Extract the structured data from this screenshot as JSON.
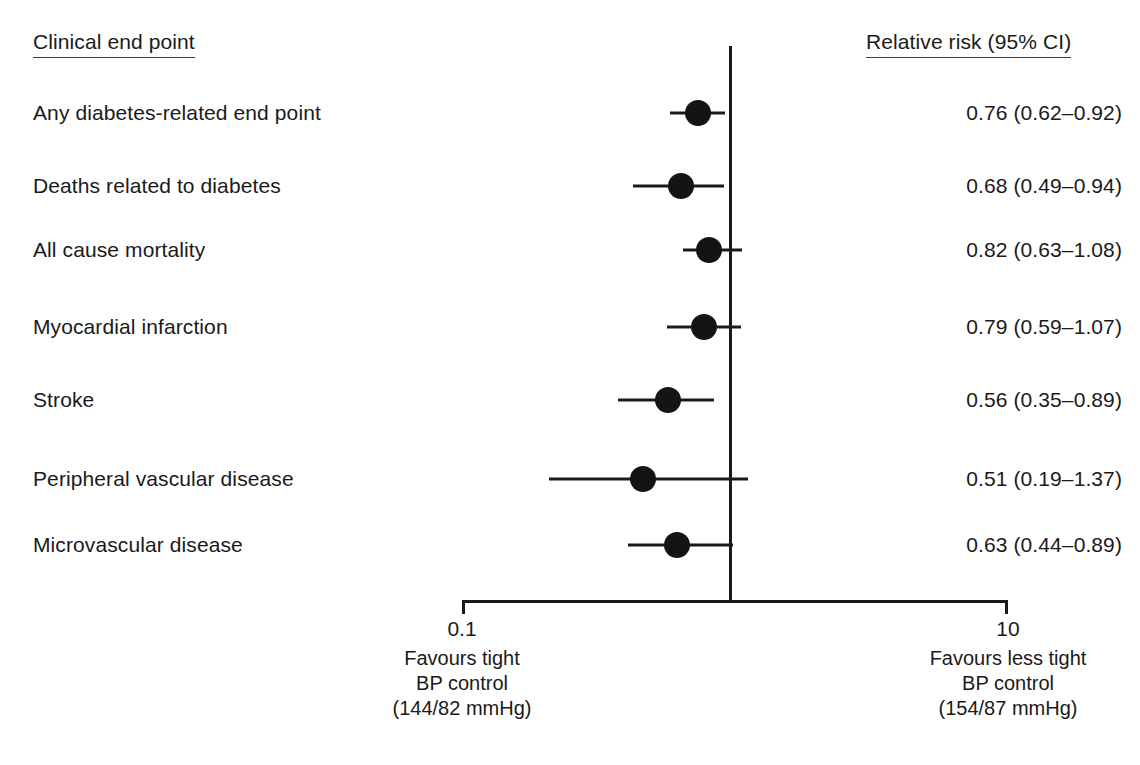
{
  "figure": {
    "type": "forest-plot",
    "width": 1140,
    "height": 765,
    "background": "#ffffff",
    "ink_color": "#1a1a1a"
  },
  "headers": {
    "left": "Clinical end point",
    "right": "Relative risk (95% CI)"
  },
  "axis": {
    "scale": "log",
    "ticks": [
      {
        "label": "0.1",
        "value": 0.1,
        "x": 462
      },
      {
        "label": "10",
        "value": 10,
        "x": 1008
      }
    ],
    "null_value": 1,
    "null_x": 730,
    "line_y": 600,
    "left_caption": {
      "line1": "Favours tight",
      "line2": "BP control",
      "line3": "(144/82 mmHg)",
      "x": 462
    },
    "right_caption": {
      "line1": "Favours less tight",
      "line2": "BP control",
      "line3": "(154/87 mmHg)",
      "x": 1008
    }
  },
  "chart_data": {
    "type": "forest",
    "title": "",
    "xlabel": "Relative risk",
    "ylabel": "",
    "xscale": "log",
    "xlim": [
      0.1,
      10
    ],
    "reference_line": 1,
    "grid": false,
    "legend": "none",
    "effect_measure": "Relative risk (95% CI)",
    "categories": [
      "Any diabetes-related end point",
      "Deaths related to diabetes",
      "All cause mortality",
      "Myocardial infarction",
      "Stroke",
      "Peripheral vascular disease",
      "Microvascular disease"
    ],
    "values": [
      0.76,
      0.68,
      0.82,
      0.79,
      0.56,
      0.51,
      0.63
    ],
    "ci_low": [
      0.62,
      0.49,
      0.63,
      0.59,
      0.35,
      0.19,
      0.44
    ],
    "ci_high": [
      0.92,
      0.94,
      1.08,
      1.07,
      0.89,
      1.37,
      0.89
    ]
  },
  "rows": [
    {
      "label": "Any diabetes-related end point",
      "value_text": "0.76 (0.62–0.92)",
      "rr": 0.76,
      "lo": 0.62,
      "hi": 0.92,
      "y": 113,
      "x_center": 698,
      "x_lo": 670,
      "x_hi": 725
    },
    {
      "label": "Deaths related to diabetes",
      "value_text": "0.68 (0.49–0.94)",
      "rr": 0.68,
      "lo": 0.49,
      "hi": 0.94,
      "y": 186,
      "x_center": 681,
      "x_lo": 633,
      "x_hi": 724
    },
    {
      "label": "All cause mortality",
      "value_text": "0.82 (0.63–1.08)",
      "rr": 0.82,
      "lo": 0.63,
      "hi": 1.08,
      "y": 250,
      "x_center": 709,
      "x_lo": 683,
      "x_hi": 742
    },
    {
      "label": "Myocardial infarction",
      "value_text": "0.79 (0.59–1.07)",
      "rr": 0.79,
      "lo": 0.59,
      "hi": 1.07,
      "y": 327,
      "x_center": 704,
      "x_lo": 667,
      "x_hi": 741
    },
    {
      "label": "Stroke",
      "value_text": "0.56 (0.35–0.89)",
      "rr": 0.56,
      "lo": 0.35,
      "hi": 0.89,
      "y": 400,
      "x_center": 668,
      "x_lo": 618,
      "x_hi": 714
    },
    {
      "label": "Peripheral vascular disease",
      "value_text": "0.51 (0.19–1.37)",
      "rr": 0.51,
      "lo": 0.19,
      "hi": 1.37,
      "y": 479,
      "x_center": 643,
      "x_lo": 549,
      "x_hi": 748
    },
    {
      "label": "Microvascular disease",
      "value_text": "0.63 (0.44–0.89)",
      "rr": 0.63,
      "lo": 0.44,
      "hi": 0.89,
      "y": 545,
      "x_center": 677,
      "x_lo": 628,
      "x_hi": 733
    }
  ]
}
